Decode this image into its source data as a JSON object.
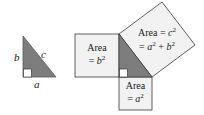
{
  "diagram": {
    "left_triangle": {
      "side_labels": {
        "a": "a",
        "b": "b",
        "c": "c"
      }
    },
    "squares": {
      "b_square": {
        "line1": "Area",
        "line2_prefix": "= ",
        "line2_var": "b",
        "line2_exp": "2"
      },
      "a_square": {
        "line1": "Area",
        "line2_prefix": "= ",
        "line2_var": "a",
        "line2_exp": "2"
      },
      "c_square": {
        "line1_prefix": "Area = ",
        "line1_var": "c",
        "line1_exp": "2",
        "line2_prefix": "= ",
        "line2_var_a": "a",
        "line2_exp_a": "2",
        "line2_plus": " + ",
        "line2_var_b": "b",
        "line2_exp_b": "2"
      }
    },
    "colors": {
      "triangle_fill": "#7d7d7d",
      "square_fill": "#f2f2f2",
      "stroke": "#3a3a3a",
      "right_angle_fill": "#ffffff"
    }
  }
}
